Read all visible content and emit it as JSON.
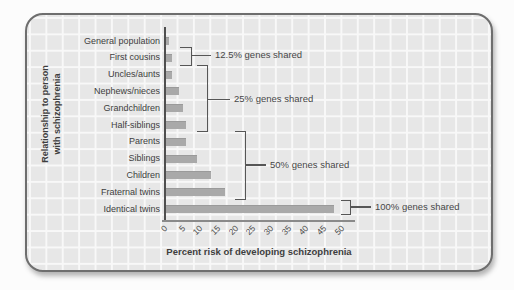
{
  "chart_data": {
    "type": "bar",
    "orientation": "horizontal",
    "title": "",
    "xlabel": "Percent risk of developing schizophrenia",
    "ylabel_lines": [
      "Relationship to person",
      "with schizophrenia"
    ],
    "categories": [
      "General population",
      "First cousins",
      "Uncles/aunts",
      "Nephews/nieces",
      "Grandchildren",
      "Half-siblings",
      "Parents",
      "Siblings",
      "Children",
      "Fraternal twins",
      "Identical twins"
    ],
    "values": [
      1,
      2,
      2,
      4,
      5,
      6,
      6,
      9,
      13,
      17,
      48
    ],
    "x_ticks": [
      0,
      5,
      10,
      15,
      20,
      25,
      30,
      35,
      40,
      45,
      50
    ],
    "xlim": [
      0,
      50
    ],
    "grid": "graph-paper background",
    "legend": "none",
    "bar_color": "#a9a9a9",
    "annotations": [
      {
        "label": "12.5% genes shared",
        "applies_to": [
          "First cousins"
        ]
      },
      {
        "label": "25% genes shared",
        "applies_to": [
          "Uncles/aunts",
          "Nephews/nieces",
          "Grandchildren",
          "Half-siblings"
        ]
      },
      {
        "label": "50% genes shared",
        "applies_to": [
          "Parents",
          "Siblings",
          "Children",
          "Fraternal twins"
        ]
      },
      {
        "label": "100% genes shared",
        "applies_to": [
          "Identical twins"
        ]
      }
    ]
  }
}
